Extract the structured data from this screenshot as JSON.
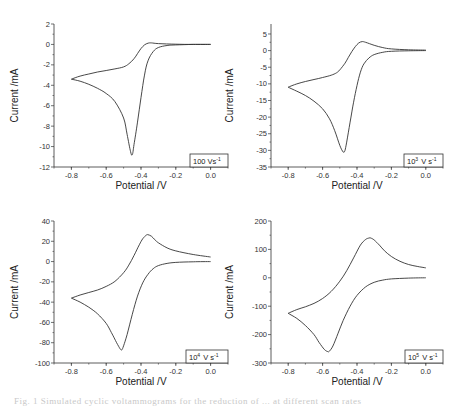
{
  "figure": {
    "caption": "Fig. 1 Simulated cyclic voltammograms for the reduction of ... at different scan rates"
  },
  "chart_data": [
    {
      "type": "line",
      "title": "",
      "legend": "100 V s-1",
      "legend_base": "100 Vs",
      "legend_sup": "-1",
      "xlabel": "Potential /V",
      "ylabel": "Current /mA",
      "xlim": [
        -0.9,
        0.1
      ],
      "ylim": [
        -12,
        2
      ],
      "xticks": [
        -0.8,
        -0.6,
        -0.4,
        -0.2,
        0.0
      ],
      "xtick_labels": [
        "-0.8",
        "-0.6",
        "-0.4",
        "-0.2",
        "0.0"
      ],
      "yticks": [
        2,
        0,
        -2,
        -4,
        -6,
        -8,
        -10,
        -12
      ],
      "ytick_labels": [
        "2",
        "0",
        "-2",
        "-4",
        "-6",
        "-8",
        "-10",
        "-12"
      ],
      "series": [
        {
          "name": "forward scan",
          "x": [
            0.0,
            -0.1,
            -0.2,
            -0.25,
            -0.3,
            -0.33,
            -0.36,
            -0.38,
            -0.4,
            -0.42,
            -0.44,
            -0.45,
            -0.46,
            -0.48,
            -0.5,
            -0.55,
            -0.6,
            -0.65,
            -0.7,
            -0.75,
            -0.8
          ],
          "y": [
            0,
            0,
            -0.05,
            -0.1,
            -0.3,
            -0.7,
            -1.6,
            -3.0,
            -5.2,
            -7.6,
            -9.8,
            -10.8,
            -10.5,
            -8.8,
            -7.2,
            -5.6,
            -4.8,
            -4.3,
            -3.9,
            -3.6,
            -3.4
          ]
        },
        {
          "name": "reverse scan",
          "x": [
            -0.8,
            -0.75,
            -0.7,
            -0.65,
            -0.6,
            -0.55,
            -0.5,
            -0.47,
            -0.44,
            -0.42,
            -0.4,
            -0.38,
            -0.36,
            -0.34,
            -0.3,
            -0.2,
            -0.1,
            0.0
          ],
          "y": [
            -3.4,
            -3.1,
            -2.9,
            -2.7,
            -2.55,
            -2.4,
            -2.2,
            -1.9,
            -1.4,
            -0.9,
            -0.4,
            -0.05,
            0.12,
            0.15,
            0.08,
            0.02,
            0.0,
            0.0
          ]
        }
      ]
    },
    {
      "type": "line",
      "title": "",
      "legend": "10^3 V s-1",
      "legend_base": "10",
      "legend_exp": "3",
      "legend_unit": "V s",
      "legend_sup": "-1",
      "xlabel": "Potential /V",
      "ylabel": "Current /mA",
      "xlim": [
        -0.9,
        0.1
      ],
      "ylim": [
        -35,
        8
      ],
      "xticks": [
        -0.8,
        -0.6,
        -0.4,
        -0.2,
        0.0
      ],
      "xtick_labels": [
        "-0.8",
        "-0.6",
        "-0.4",
        "-0.2",
        "0.0"
      ],
      "yticks": [
        5,
        0,
        -5,
        -10,
        -15,
        -20,
        -25,
        -30,
        -35
      ],
      "ytick_labels": [
        "5",
        "0",
        "-5",
        "-10",
        "-15",
        "-20",
        "-25",
        "-30",
        "-35"
      ],
      "series": [
        {
          "name": "forward scan",
          "x": [
            0.0,
            -0.1,
            -0.2,
            -0.25,
            -0.3,
            -0.33,
            -0.36,
            -0.38,
            -0.4,
            -0.42,
            -0.44,
            -0.46,
            -0.47,
            -0.48,
            -0.5,
            -0.53,
            -0.56,
            -0.6,
            -0.65,
            -0.7,
            -0.75,
            -0.8
          ],
          "y": [
            0,
            -0.05,
            -0.2,
            -0.5,
            -1.2,
            -2.2,
            -4.0,
            -6.5,
            -10.5,
            -15.5,
            -21.5,
            -27.5,
            -30.0,
            -30.5,
            -28.5,
            -24.0,
            -20.5,
            -17.5,
            -15.2,
            -13.5,
            -12.2,
            -11.0
          ]
        },
        {
          "name": "reverse scan",
          "x": [
            -0.8,
            -0.75,
            -0.7,
            -0.65,
            -0.6,
            -0.55,
            -0.52,
            -0.5,
            -0.47,
            -0.45,
            -0.43,
            -0.41,
            -0.39,
            -0.37,
            -0.35,
            -0.3,
            -0.25,
            -0.2,
            -0.1,
            0.0
          ],
          "y": [
            -11.0,
            -10.0,
            -9.3,
            -8.7,
            -8.1,
            -7.4,
            -6.7,
            -5.8,
            -3.8,
            -2.0,
            -0.3,
            1.2,
            2.3,
            2.7,
            2.5,
            1.6,
            0.9,
            0.5,
            0.25,
            0.15
          ]
        }
      ]
    },
    {
      "type": "line",
      "title": "",
      "legend": "10^4 V s-1",
      "legend_base": "10",
      "legend_exp": "4",
      "legend_unit": "V s",
      "legend_sup": "-1",
      "xlabel": "Potential /V",
      "ylabel": "Current /mA",
      "xlim": [
        -0.9,
        0.1
      ],
      "ylim": [
        -100,
        40
      ],
      "xticks": [
        -0.8,
        -0.6,
        -0.4,
        -0.2,
        0.0
      ],
      "xtick_labels": [
        "-0.8",
        "-0.6",
        "-0.4",
        "-0.2",
        "0.0"
      ],
      "yticks": [
        40,
        20,
        0,
        -20,
        -40,
        -60,
        -80,
        -100
      ],
      "ytick_labels": [
        "40",
        "20",
        "0",
        "-20",
        "-40",
        "-60",
        "-80",
        "-100"
      ],
      "series": [
        {
          "name": "forward scan",
          "x": [
            0.0,
            -0.1,
            -0.2,
            -0.25,
            -0.3,
            -0.33,
            -0.36,
            -0.39,
            -0.42,
            -0.45,
            -0.48,
            -0.5,
            -0.51,
            -0.52,
            -0.54,
            -0.57,
            -0.6,
            -0.65,
            -0.7,
            -0.75,
            -0.8
          ],
          "y": [
            0,
            -0.2,
            -0.8,
            -1.8,
            -4.0,
            -7.0,
            -12.5,
            -21.0,
            -34.0,
            -52.0,
            -72.0,
            -83.0,
            -87.0,
            -86.0,
            -80.0,
            -70.0,
            -61.0,
            -51.5,
            -45.0,
            -40.0,
            -36.0
          ]
        },
        {
          "name": "reverse scan",
          "x": [
            -0.8,
            -0.75,
            -0.7,
            -0.65,
            -0.6,
            -0.55,
            -0.5,
            -0.47,
            -0.44,
            -0.41,
            -0.39,
            -0.37,
            -0.36,
            -0.34,
            -0.32,
            -0.3,
            -0.25,
            -0.2,
            -0.1,
            0.0
          ],
          "y": [
            -36.0,
            -33.0,
            -30.5,
            -28.0,
            -24.5,
            -19.5,
            -11.0,
            -3.5,
            6.0,
            16.5,
            22.5,
            26.0,
            26.5,
            25.0,
            21.5,
            18.5,
            13.5,
            10.5,
            7.0,
            4.5
          ]
        }
      ]
    },
    {
      "type": "line",
      "title": "",
      "legend": "10^5 V s-1",
      "legend_base": "10",
      "legend_exp": "5",
      "legend_unit": "V s",
      "legend_sup": "-1",
      "xlabel": "Potential /V",
      "ylabel": "Current /mA",
      "xlim": [
        -0.9,
        0.1
      ],
      "ylim": [
        -300,
        200
      ],
      "xticks": [
        -0.8,
        -0.6,
        -0.4,
        -0.2,
        0.0
      ],
      "xtick_labels": [
        "-0.8",
        "-0.6",
        "-0.4",
        "-0.2",
        "0.0"
      ],
      "yticks": [
        200,
        100,
        0,
        -100,
        -200,
        -300
      ],
      "ytick_labels": [
        "200",
        "100",
        "0",
        "-100",
        "-200",
        "-300"
      ],
      "series": [
        {
          "name": "forward scan",
          "x": [
            0.0,
            -0.1,
            -0.2,
            -0.25,
            -0.3,
            -0.35,
            -0.4,
            -0.44,
            -0.48,
            -0.51,
            -0.54,
            -0.56,
            -0.57,
            -0.59,
            -0.62,
            -0.65,
            -0.7,
            -0.75,
            -0.8
          ],
          "y": [
            0,
            -1,
            -4,
            -8,
            -16,
            -32,
            -62,
            -100,
            -150,
            -195,
            -240,
            -258,
            -260,
            -252,
            -228,
            -200,
            -168,
            -143,
            -125
          ]
        },
        {
          "name": "reverse scan",
          "x": [
            -0.8,
            -0.75,
            -0.7,
            -0.65,
            -0.6,
            -0.55,
            -0.5,
            -0.46,
            -0.42,
            -0.38,
            -0.35,
            -0.33,
            -0.32,
            -0.3,
            -0.27,
            -0.24,
            -0.2,
            -0.15,
            -0.1,
            -0.05,
            0.0
          ],
          "y": [
            -125,
            -112,
            -102,
            -90,
            -73,
            -48,
            -12,
            25,
            70,
            115,
            135,
            140,
            140,
            133,
            115,
            95,
            75,
            58,
            47,
            40,
            35
          ]
        }
      ]
    }
  ]
}
